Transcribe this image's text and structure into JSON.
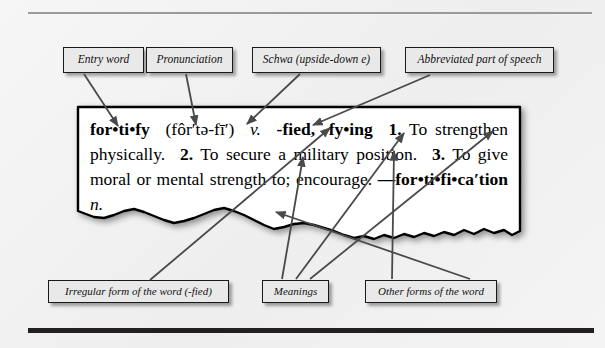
{
  "figure": {
    "type": "dictionary-entry-diagram",
    "accent_color": "#1a1a1a",
    "callout_fill": "#e9e9e9",
    "page_background": "#f2f2f2"
  },
  "callouts": {
    "top": [
      {
        "id": "entry-word",
        "label": "Entry word"
      },
      {
        "id": "pronunciation",
        "label": "Pronunciation"
      },
      {
        "id": "schwa",
        "label": "Schwa (upside-down e)"
      },
      {
        "id": "part-of-speech",
        "label": "Abbreviated part of speech"
      }
    ],
    "bottom": [
      {
        "id": "irregular-form",
        "label": "Irregular form of the word (-fied)"
      },
      {
        "id": "meanings",
        "label": "Meanings"
      },
      {
        "id": "other-forms",
        "label": "Other forms of the word"
      }
    ]
  },
  "entry": {
    "headword": "for•ti•fy",
    "pronunciation": "(fôr′tə-fī′)",
    "part_of_speech": "v.",
    "inflections": "-fied, -fy•ing",
    "senses": [
      {
        "number": "1.",
        "text": "To strengthen physically."
      },
      {
        "number": "2.",
        "text": "To secure a military position."
      },
      {
        "number": "3.",
        "text": "To give moral or mental strength to; encourage."
      }
    ],
    "derived_form": "—for•ti•fi•ca′tion",
    "derived_part_of_speech": "n."
  }
}
